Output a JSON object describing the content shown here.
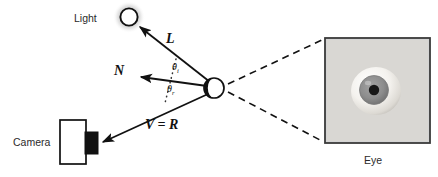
{
  "figure": {
    "type": "optics-reflection-diagram",
    "background_color": "#ffffff",
    "stroke_color": "#111111"
  },
  "labels": {
    "light": "Light",
    "camera": "Camera",
    "eye": "Eye",
    "vector_l": "L",
    "vector_n": "N",
    "vector_v_equals_r": "V = R",
    "theta_incident": "θ",
    "theta_incident_sub": "i",
    "theta_reflected": "θ",
    "theta_reflected_sub": "r"
  },
  "geometry": {
    "light_center": {
      "x": 129,
      "y": 17,
      "r": 9
    },
    "surface_point": {
      "x": 214,
      "y": 88,
      "r": 10
    },
    "normal_arrow_tip": {
      "x": 136,
      "y": 78
    },
    "camera_body": {
      "x": 60,
      "y": 120,
      "w": 26,
      "h": 44
    },
    "camera_lens": {
      "x": 86,
      "y": 132,
      "w": 12,
      "h": 22
    },
    "camera_arrow_tip": {
      "x": 99,
      "y": 143
    },
    "eye_box": {
      "x": 325,
      "y": 38,
      "w": 105,
      "h": 105
    },
    "eyeball_center": {
      "x": 374,
      "y": 91,
      "r": 24
    },
    "iris_r": 14,
    "pupil_r": 5
  },
  "colors": {
    "eye_box_fill": "#d4d4d4",
    "eye_box_border": "#3a3a3a",
    "sclera": "#f2f0ec",
    "iris": "#8c8c8c",
    "pupil": "#171717",
    "glow": "#9a9a9a",
    "camera_body_fill": "#ffffff",
    "camera_lens_fill": "#111111"
  }
}
